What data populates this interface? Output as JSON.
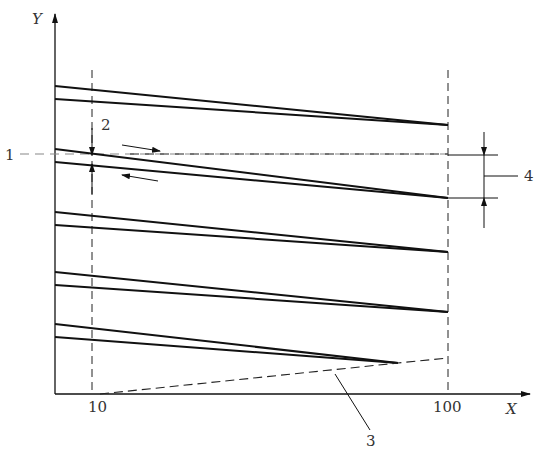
{
  "diagram": {
    "axes": {
      "x_label": "X",
      "y_label": "Y",
      "x_ticks": [
        "10",
        "100"
      ]
    },
    "callouts": {
      "c1": "1",
      "c2": "2",
      "c3": "3",
      "c4": "4"
    },
    "line_pairs": [
      {
        "upper": [
          [
            55,
            86
          ],
          [
            448,
            125
          ]
        ],
        "lower": [
          [
            55,
            99
          ],
          [
            448,
            125
          ]
        ]
      },
      {
        "upper": [
          [
            55,
            149
          ],
          [
            448,
            198
          ]
        ],
        "lower": [
          [
            55,
            162
          ],
          [
            448,
            198
          ]
        ]
      },
      {
        "upper": [
          [
            55,
            212
          ],
          [
            448,
            252
          ]
        ],
        "lower": [
          [
            55,
            225
          ],
          [
            448,
            252
          ]
        ]
      },
      {
        "upper": [
          [
            55,
            272
          ],
          [
            448,
            312
          ]
        ],
        "lower": [
          [
            55,
            285
          ],
          [
            448,
            312
          ]
        ]
      },
      {
        "upper": [
          [
            55,
            324
          ],
          [
            398,
            363
          ]
        ],
        "lower": [
          [
            55,
            337
          ],
          [
            398,
            363
          ]
        ]
      }
    ],
    "colors": {
      "line": "#111111",
      "dashed": "#222222",
      "reference": "#888888"
    }
  }
}
